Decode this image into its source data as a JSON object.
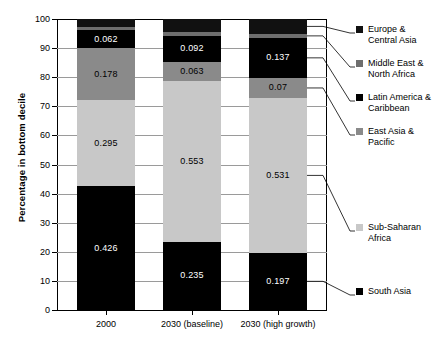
{
  "chart_data": {
    "type": "bar",
    "title": "",
    "subtitle": "",
    "xlabel": "",
    "ylabel": "Percentage in bottom decile",
    "ylim": [
      0,
      100
    ],
    "ytick_labels": [
      "100",
      "90",
      "80",
      "70",
      "60",
      "50",
      "40",
      "30",
      "20",
      "10",
      "0"
    ],
    "ytick_values": [
      100,
      90,
      80,
      70,
      60,
      50,
      40,
      30,
      20,
      10,
      0
    ],
    "grid": true,
    "grid_axis": "y",
    "stacked": true,
    "legend_position": "right",
    "categories": [
      "2000",
      "2030 (baseline)",
      "2030 (high growth)"
    ],
    "series": [
      {
        "name": "South Asia",
        "color": "#000000",
        "values": [
          42.6,
          23.5,
          19.7
        ],
        "labels": [
          "0.426",
          "0.235",
          "0.197"
        ]
      },
      {
        "name": "Sub-Saharan Africa",
        "color": "#c8c8c8",
        "values": [
          29.5,
          55.3,
          53.1
        ],
        "labels": [
          "0.295",
          "0.553",
          "0.531"
        ]
      },
      {
        "name": "East Asia & Pacific",
        "color": "#8a8a8a",
        "values": [
          17.8,
          6.3,
          7.0
        ],
        "labels": [
          "0.178",
          "0.063",
          "0.07"
        ]
      },
      {
        "name": "Latin America & Caribbean",
        "color": "#000000",
        "values": [
          6.2,
          9.2,
          13.7
        ],
        "labels": [
          "0.062",
          "0.092",
          "0.137"
        ]
      },
      {
        "name": "Middle East & North Africa",
        "color": "#6e6e6e",
        "values": [
          1.3,
          1.4,
          1.4
        ],
        "labels": [
          "",
          "",
          ""
        ]
      },
      {
        "name": "Europe & Central Asia",
        "color": "#111111",
        "values": [
          2.6,
          4.3,
          5.1
        ],
        "labels": [
          "",
          "",
          ""
        ]
      }
    ]
  },
  "legend": {
    "entries": [
      {
        "label": "Europe &\nCentral Asia",
        "swatch": "#111111"
      },
      {
        "label": "Middle East &\nNorth Africa",
        "swatch": "#6e6e6e"
      },
      {
        "label": "Latin America &\nCaribbean",
        "swatch": "#000000"
      },
      {
        "label": "East Asia &\nPacific",
        "swatch": "#8a8a8a"
      },
      {
        "label": "Sub-Saharan\nAfrica",
        "swatch": "#c8c8c8"
      },
      {
        "label": "South Asia",
        "swatch": "#000000"
      }
    ]
  }
}
